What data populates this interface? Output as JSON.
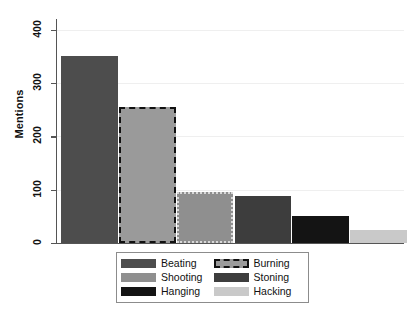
{
  "chart_data": {
    "type": "bar",
    "title": "",
    "xlabel": "",
    "ylabel": "Mentions",
    "ylim": [
      0,
      420
    ],
    "yticks": [
      0,
      100,
      200,
      300,
      400
    ],
    "ytick_labels": [
      "0",
      "100",
      "200",
      "300",
      "400"
    ],
    "grid": true,
    "legend_position": "bottom-center",
    "categories": [
      "Beating",
      "Burning",
      "Hanging",
      "Stoning",
      "Shooting",
      "Hacking"
    ],
    "values": [
      350,
      255,
      95,
      88,
      50,
      25
    ],
    "bars": [
      {
        "label": "Beating",
        "value": 350,
        "color": "#4d4d4d",
        "border_color": "#4d4d4d",
        "border_style": "solid"
      },
      {
        "label": "Burning",
        "value": 255,
        "color": "#9a9a9a",
        "border_color": "#111111",
        "border_style": "dashed"
      },
      {
        "label": "Hanging",
        "value": 95,
        "color": "#8f8f8f",
        "border_color": "#d8d8d8",
        "border_style": "dotted"
      },
      {
        "label": "Stoning",
        "value": 88,
        "color": "#3d3d3d",
        "border_color": "#3d3d3d",
        "border_style": "solid"
      },
      {
        "label": "Shooting",
        "value": 50,
        "color": "#141414",
        "border_color": "#141414",
        "border_style": "solid"
      },
      {
        "label": "Hacking",
        "value": 25,
        "color": "#c9c9c9",
        "border_color": "#c9c9c9",
        "border_style": "solid"
      }
    ]
  },
  "axis": {
    "y_title": "Mentions",
    "ticks": [
      {
        "label": "400",
        "value": 400
      },
      {
        "label": "300",
        "value": 300
      },
      {
        "label": "200",
        "value": 200
      },
      {
        "label": "100",
        "value": 100
      },
      {
        "label": "0",
        "value": 0
      }
    ]
  },
  "legend": {
    "entries": [
      {
        "label": "Beating",
        "color": "#4d4d4d",
        "border_color": "#4d4d4d",
        "border_style": "solid"
      },
      {
        "label": "Burning",
        "color": "#9a9a9a",
        "border_color": "#111111",
        "border_style": "dashed"
      },
      {
        "label": "Shooting",
        "color": "#8f8f8f",
        "border_color": "#8f8f8f",
        "border_style": "solid"
      },
      {
        "label": "Stoning",
        "color": "#3d3d3d",
        "border_color": "#3d3d3d",
        "border_style": "solid"
      },
      {
        "label": "Hanging",
        "color": "#141414",
        "border_color": "#141414",
        "border_style": "solid"
      },
      {
        "label": "Hacking",
        "color": "#c9c9c9",
        "border_color": "#c9c9c9",
        "border_style": "solid"
      }
    ]
  },
  "colors": {
    "background": "#ffffff",
    "gridline": "#efefef",
    "axis": "#555555",
    "text": "#111111",
    "legend_border": "#8c8c8c"
  }
}
